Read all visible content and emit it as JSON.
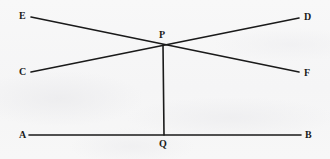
{
  "figure": {
    "kind": "geometry-diagram",
    "width": 330,
    "height": 159,
    "background_color": "#f7f7f7",
    "stroke_color": "#1a1a1a",
    "label_color": "#1b1b1b",
    "stroke_width": 1.6
  },
  "points": {
    "A": {
      "label": "A",
      "x": 29,
      "y": 135,
      "label_x": 19,
      "label_y": 130
    },
    "B": {
      "label": "B",
      "x": 301,
      "y": 135,
      "label_x": 305,
      "label_y": 130
    },
    "C": {
      "label": "C",
      "x": 31,
      "y": 72,
      "label_x": 19,
      "label_y": 67
    },
    "D": {
      "label": "D",
      "x": 299,
      "y": 18,
      "label_x": 304,
      "label_y": 12
    },
    "E": {
      "label": "E",
      "x": 31,
      "y": 17,
      "label_x": 19,
      "label_y": 11
    },
    "F": {
      "label": "F",
      "x": 299,
      "y": 72,
      "label_x": 304,
      "label_y": 68
    },
    "P": {
      "label": "P",
      "x": 163,
      "y": 45,
      "label_x": 159,
      "label_y": 30
    },
    "Q": {
      "label": "Q",
      "x": 164,
      "y": 135,
      "label_x": 159,
      "label_y": 139
    }
  },
  "segments": [
    {
      "name": "segment-EF",
      "from": "E",
      "to": "F",
      "x1": 31,
      "y1": 17,
      "x2": 299,
      "y2": 72
    },
    {
      "name": "segment-CD",
      "from": "C",
      "to": "D",
      "x1": 31,
      "y1": 72,
      "x2": 299,
      "y2": 18
    },
    {
      "name": "segment-AB",
      "from": "A",
      "to": "B",
      "x1": 29,
      "y1": 135,
      "x2": 301,
      "y2": 135
    },
    {
      "name": "segment-PQ",
      "from": "P",
      "to": "Q",
      "x1": 163,
      "y1": 45,
      "x2": 164,
      "y2": 135
    }
  ]
}
